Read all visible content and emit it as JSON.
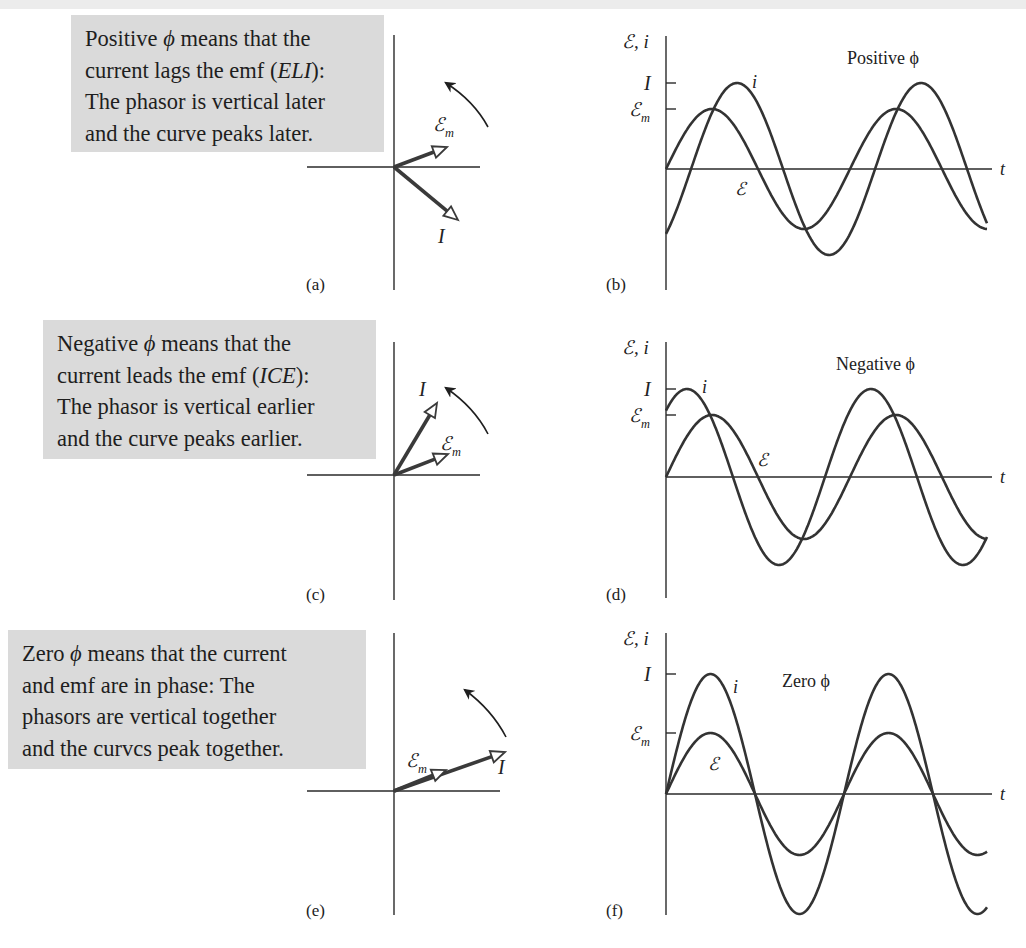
{
  "figure": {
    "panels": [
      {
        "id": "a",
        "label": "(a)",
        "caption_lines": [
          [
            "Positive ",
            {
              "it": "ϕ"
            },
            " means that the"
          ],
          [
            "current lags the emf (",
            {
              "it": "ELI"
            },
            "):"
          ],
          [
            "The phasor is vertical later"
          ],
          [
            "and the curve peaks later."
          ]
        ],
        "phasor_labels": {
          "emf": "ℰ",
          "emf_sub": "m",
          "current": "I"
        }
      },
      {
        "id": "b",
        "label": "(b)",
        "title": "Positive ϕ",
        "y_axis_label": "ℰ, i",
        "x_axis_label": "t",
        "tick_labels": {
          "I": "I",
          "Em": "ℰ",
          "Em_sub": "m"
        },
        "curve_labels": {
          "current": "i",
          "emf": "ℰ"
        }
      },
      {
        "id": "c",
        "label": "(c)",
        "caption_lines": [
          [
            "Negative ",
            {
              "it": "ϕ"
            },
            " means that the"
          ],
          [
            "current leads the emf (",
            {
              "it": "ICE"
            },
            "):"
          ],
          [
            "The phasor is vertical earlier"
          ],
          [
            "and the curve peaks earlier."
          ]
        ],
        "phasor_labels": {
          "emf": "ℰ",
          "emf_sub": "m",
          "current": "I"
        }
      },
      {
        "id": "d",
        "label": "(d)",
        "title": "Negative ϕ",
        "y_axis_label": "ℰ, i",
        "x_axis_label": "t",
        "tick_labels": {
          "I": "I",
          "Em": "ℰ",
          "Em_sub": "m"
        },
        "curve_labels": {
          "current": "i",
          "emf": "ℰ"
        }
      },
      {
        "id": "e",
        "label": "(e)",
        "caption_lines": [
          [
            "Zero ",
            {
              "it": "ϕ"
            },
            " means that the current"
          ],
          [
            "and emf are in phase: The"
          ],
          [
            "phasors are vertical together"
          ],
          [
            "and the curvcs peak together."
          ]
        ],
        "phasor_labels": {
          "emf": "ℰ",
          "emf_sub": "m",
          "current": "I"
        }
      },
      {
        "id": "f",
        "label": "(f)",
        "title": "Zero ϕ",
        "y_axis_label": "ℰ, i",
        "x_axis_label": "t",
        "tick_labels": {
          "I": "I",
          "Em": "ℰ",
          "Em_sub": "m"
        },
        "curve_labels": {
          "current": "i",
          "emf": "ℰ"
        }
      }
    ]
  },
  "chart_data": [
    {
      "type": "line",
      "panel": "b",
      "title": "Positive ϕ",
      "xlabel": "t",
      "ylabel": "ℰ, i",
      "y_ticks": [
        "I",
        "ℰm"
      ],
      "series": [
        {
          "name": "ℰ (emf)",
          "amplitude_rel": 0.7,
          "phase_deg": 0,
          "cycles_shown": 1.75
        },
        {
          "name": "i (current)",
          "amplitude_rel": 1.0,
          "phase_deg": -49,
          "cycles_shown": 1.75
        }
      ],
      "note": "current lags the emf by phase constant ϕ (ELI)"
    },
    {
      "type": "line",
      "panel": "d",
      "title": "Negative ϕ",
      "xlabel": "t",
      "ylabel": "ℰ, i",
      "y_ticks": [
        "I",
        "ℰm"
      ],
      "series": [
        {
          "name": "ℰ (emf)",
          "amplitude_rel": 0.7,
          "phase_deg": 0,
          "cycles_shown": 1.75
        },
        {
          "name": "i (current)",
          "amplitude_rel": 1.0,
          "phase_deg": 49,
          "cycles_shown": 1.75
        }
      ],
      "note": "current leads the emf (ICE)"
    },
    {
      "type": "line",
      "panel": "f",
      "title": "Zero ϕ",
      "xlabel": "t",
      "ylabel": "ℰ, i",
      "y_ticks": [
        "I",
        "ℰm"
      ],
      "series": [
        {
          "name": "ℰ (emf)",
          "amplitude_rel": 0.5,
          "phase_deg": 0,
          "cycles_shown": 1.78
        },
        {
          "name": "i (current)",
          "amplitude_rel": 1.0,
          "phase_deg": 0,
          "cycles_shown": 1.78
        }
      ],
      "note": "current and emf in phase"
    }
  ],
  "geometry": {
    "graphs": [
      {
        "panel": "b",
        "x0": 666,
        "y0": 169,
        "x_end": 987,
        "axis_end": 992,
        "axis_top": 36,
        "axis_bottom": 290,
        "amp_I": 86,
        "amp_E": 60,
        "period": 184,
        "phase_I_deg": -49,
        "phase_E_deg": 0,
        "title_pos": [
          847,
          64
        ],
        "label_i_pos": [
          752,
          88
        ],
        "label_E_pos": [
          735,
          195
        ],
        "panel_label_pos": [
          606,
          290
        ]
      },
      {
        "panel": "d",
        "x0": 666,
        "y0": 477,
        "x_end": 987,
        "axis_end": 992,
        "axis_top": 342,
        "axis_bottom": 598,
        "amp_I": 88,
        "amp_E": 62,
        "period": 184,
        "phase_I_deg": 49,
        "phase_E_deg": 0,
        "title_pos": [
          836,
          370
        ],
        "label_i_pos": [
          702,
          393
        ],
        "label_E_pos": [
          757,
          466
        ],
        "panel_label_pos": [
          606,
          600
        ]
      },
      {
        "panel": "f",
        "x0": 666,
        "y0": 794,
        "x_end": 987,
        "axis_end": 992,
        "axis_top": 633,
        "axis_bottom": 915,
        "amp_I": 120,
        "amp_E": 61,
        "period": 178,
        "phase_I_deg": 0,
        "phase_E_deg": 0,
        "title_pos": [
          782,
          687
        ],
        "label_i_pos": [
          733,
          693
        ],
        "label_E_pos": [
          708,
          770
        ],
        "panel_label_pos": [
          606,
          916
        ]
      }
    ],
    "phasors": [
      {
        "panel": "a",
        "ox": 394,
        "oy": 167,
        "v_top": 35,
        "v_bottom": 290,
        "h_left": 307,
        "h_right": 480,
        "emf_tip": [
          447,
          147
        ],
        "cur_tip": [
          458,
          220
        ],
        "emf_label": [
          433,
          131
        ],
        "cur_label": [
          438,
          243
        ],
        "arc": [
          [
            488,
            127
          ],
          [
            474,
            101
          ],
          [
            446,
            83
          ]
        ],
        "panel_label": [
          306,
          290
        ]
      },
      {
        "panel": "c",
        "ox": 394,
        "oy": 475,
        "v_top": 342,
        "v_bottom": 600,
        "h_left": 307,
        "h_right": 480,
        "emf_tip": [
          448,
          454
        ],
        "cur_tip": [
          437,
          403
        ],
        "emf_label": [
          440,
          450
        ],
        "cur_label": [
          419,
          396
        ],
        "arc": [
          [
            488,
            434
          ],
          [
            474,
            407
          ],
          [
            446,
            388
          ]
        ],
        "panel_label": [
          306,
          600
        ]
      },
      {
        "panel": "e",
        "ox": 394,
        "oy": 791,
        "v_top": 633,
        "v_bottom": 915,
        "h_left": 307,
        "h_right": 500,
        "emf_tip": [
          446,
          770
        ],
        "cur_tip": [
          505,
          752
        ],
        "emf_label": [
          406,
          767
        ],
        "cur_label": [
          498,
          774
        ],
        "arc": [
          [
            506,
            737
          ],
          [
            492,
            710
          ],
          [
            465,
            690
          ]
        ],
        "panel_label": [
          306,
          916
        ]
      }
    ],
    "caption_boxes": [
      {
        "panel": "a",
        "left": 71,
        "top": 15,
        "width": 313,
        "height": 137
      },
      {
        "panel": "c",
        "left": 43,
        "top": 320,
        "width": 333,
        "height": 139
      },
      {
        "panel": "e",
        "left": 8,
        "top": 630,
        "width": 358,
        "height": 139
      }
    ]
  }
}
